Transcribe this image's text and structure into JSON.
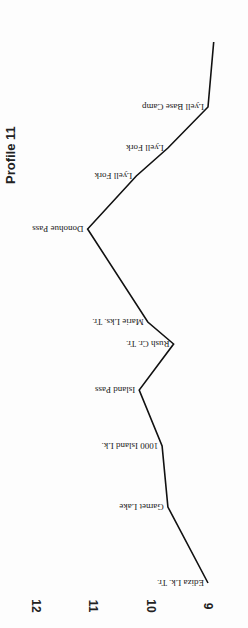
{
  "chart_data": {
    "type": "line",
    "title": "Profile 11",
    "orientation": "rotated-90 (elevation on horizontal axis, increasing to the left; route runs bottom to top)",
    "xlabel": "",
    "ylabel": "Elevation (thousands of feet)",
    "ylim": [
      9,
      12
    ],
    "y_ticks": [
      "9",
      "10",
      "11",
      "12"
    ],
    "grid": false,
    "legend": null,
    "line_color": "#111111",
    "waypoints": [
      {
        "label": "Ediza Lk. Tr.",
        "elevation": 9.0
      },
      {
        "label": "Garnet Lake",
        "elevation": 9.7
      },
      {
        "label": "1000 Island Lk.",
        "elevation": 9.8
      },
      {
        "label": "Island Pass",
        "elevation": 10.2
      },
      {
        "label": "Rush Cr. Tr.",
        "elevation": 9.6
      },
      {
        "label": "Marie Lks. Tr.",
        "elevation": 10.05
      },
      {
        "label": "Donohue Pass",
        "elevation": 11.1
      },
      {
        "label": "Lyell Fork",
        "elevation": 10.25
      },
      {
        "label": "Lyell Fork",
        "elevation": 9.7
      },
      {
        "label": "Lyell Base Camp",
        "elevation": 9.0
      },
      {
        "label": "",
        "elevation": 8.9
      }
    ],
    "positions_along_route_px": [
      583,
      507,
      446,
      390,
      344,
      322,
      229,
      176,
      148,
      107,
      42
    ]
  },
  "title": "Profile 11"
}
